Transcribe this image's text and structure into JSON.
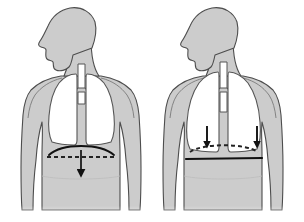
{
  "figure": {
    "type": "medical-illustration",
    "background_color": "#ffffff",
    "panel_count": 2
  },
  "colors": {
    "body_fill": "#cccccc",
    "body_fill_light": "#d4d4d4",
    "body_outline": "#4d4d4d",
    "lung_fill": "#ffffff",
    "lung_outline": "#555555",
    "airway_fill": "#ffffff",
    "airway_outline": "#555555",
    "arrow_color": "#111111",
    "diaphragm_solid": "#111111",
    "diaphragm_dashed": "#333333"
  },
  "panels": [
    {
      "id": "left-panel",
      "name": "normal-lungs-figure",
      "label": "Normal lungs with domed diaphragm",
      "lung_state": "normal",
      "lung_width": "narrow",
      "diaphragm_shape": "domed",
      "diaphragm_solid_line": "curved-arched",
      "diaphragm_dashed_line": "horizontal-flat-below",
      "arrow_count": 1,
      "arrow_description": "single large downward arrow at midline showing diaphragm descent",
      "arrows": [
        {
          "name": "diaphragm-descent-arrow",
          "x": 81,
          "y_start": 150,
          "y_end": 178,
          "size": "large"
        }
      ],
      "head_facing": "left"
    },
    {
      "id": "right-panel",
      "name": "hyperinflated-lungs-figure",
      "label": "Hyperinflated lungs with flattened diaphragm",
      "lung_state": "hyperinflated",
      "lung_width": "wide",
      "diaphragm_shape": "flattened",
      "diaphragm_solid_line": "straight-horizontal",
      "diaphragm_dashed_line": "curved-arched-above",
      "arrow_count": 2,
      "arrow_description": "two downward arrows at the lung bases showing downward displacement",
      "arrows": [
        {
          "name": "left-base-descent-arrow",
          "x": 207,
          "y_start": 128,
          "y_end": 149,
          "size": "medium"
        },
        {
          "name": "right-base-descent-arrow",
          "x": 257,
          "y_start": 128,
          "y_end": 149,
          "size": "medium"
        }
      ],
      "head_facing": "left"
    }
  ],
  "anatomy_parts": [
    {
      "name": "head-profile",
      "visible": true
    },
    {
      "name": "neck",
      "visible": true
    },
    {
      "name": "shoulders",
      "visible": true
    },
    {
      "name": "arms",
      "visible": true
    },
    {
      "name": "torso",
      "visible": true
    },
    {
      "name": "trachea",
      "visible": true
    },
    {
      "name": "main-bronchi",
      "visible": true
    },
    {
      "name": "left-lung",
      "visible": true
    },
    {
      "name": "right-lung",
      "visible": true
    },
    {
      "name": "diaphragm",
      "visible": true
    }
  ]
}
